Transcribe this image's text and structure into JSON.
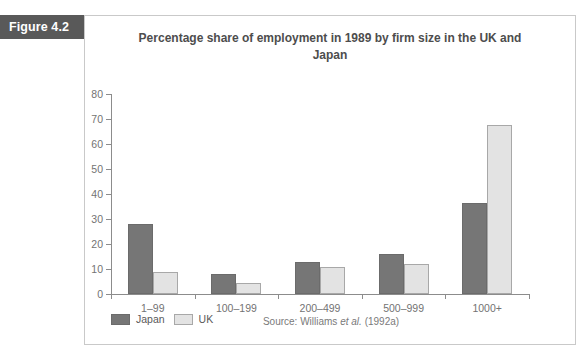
{
  "figure": {
    "banner_label": "Figure 4.2"
  },
  "source": {
    "prefix": "Source:",
    "author": "Williams",
    "etal": "et al.",
    "year": "(1992a)",
    "full": "Source: Williams et al. (1992a)"
  },
  "colors": {
    "banner_background": "#595959",
    "japan_series": "#767676",
    "uk_series": "#e3e3e3",
    "uk_series_border": "#a8a8a8",
    "axis": "#8c8c8c",
    "text": "#737373",
    "panel_border": "#c9c9c9"
  },
  "chart_data": {
    "type": "bar",
    "title": "Percentage share of employment in 1989 by firm size in the UK and Japan",
    "xlabel": "",
    "ylabel": "",
    "ylim": [
      0,
      80
    ],
    "yticks": [
      0,
      10,
      20,
      30,
      40,
      50,
      60,
      70,
      80
    ],
    "grid": false,
    "legend_position": "bottom-left",
    "categories": [
      "1–99",
      "100–199",
      "200–499",
      "500–999",
      "1000+"
    ],
    "series": [
      {
        "name": "Japan",
        "values": [
          28,
          8,
          13,
          16,
          36.5
        ]
      },
      {
        "name": "UK",
        "values": [
          9,
          4.5,
          11,
          12,
          67.5
        ]
      }
    ]
  }
}
